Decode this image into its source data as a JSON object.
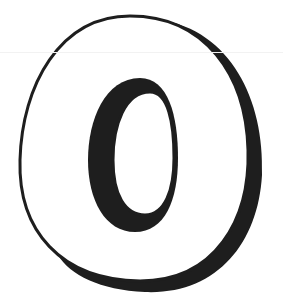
{
  "image": {
    "subject": "3D outlined letter O",
    "glyph": "O",
    "colors": {
      "background": "#ffffff",
      "fill": "#ffffff",
      "shadow": "#1e1e1e",
      "outline": "#1e1e1e"
    }
  }
}
